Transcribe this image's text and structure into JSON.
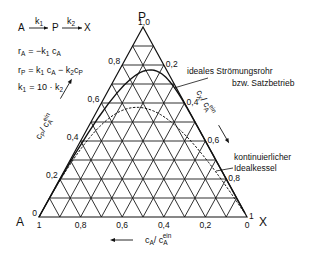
{
  "reaction": {
    "scheme": {
      "A": "A",
      "k1": "k",
      "k1_sub": "1",
      "P": "P",
      "k2": "k",
      "k2_sub": "2",
      "X": "X"
    },
    "rate_A": {
      "lhs": "r",
      "lhs_sub": "A",
      "rhs": "= −k",
      "rhs_sub1": "1",
      "c": " c",
      "c_sub": "A"
    },
    "rate_P": {
      "lhs": "r",
      "lhs_sub": "P",
      "rhs": "= k",
      "rhs_sub1": "1",
      "c1": " c",
      "c1_sub": "A",
      "minus": " − k",
      "k2_sub": "2",
      "c2": "c",
      "c2_sub": "P"
    },
    "ratio": {
      "lhs": "k",
      "lhs_sub": "1",
      "rhs": "= 10 · k",
      "rhs_sub": "2"
    }
  },
  "diagram": {
    "vertex_labels": {
      "A": "A",
      "P": "P",
      "X": "X"
    },
    "left_axis": {
      "name": "c_P / c_A^ein",
      "label_c": "c",
      "label_c_sub": "P",
      "label_slash": "/ c",
      "label_sub": "A",
      "label_sup": "ein",
      "ticks": [
        "0",
        "0,2",
        "0,4",
        "0,6",
        "0,8",
        "1,0"
      ]
    },
    "right_axis": {
      "name": "c_X / c_A^ein",
      "label_c": "c",
      "label_c_sub": "X",
      "label_slash": "/ c",
      "label_sub": "A",
      "label_sup": "ein",
      "ticks": [
        "0",
        "0,2",
        "0,4",
        "0,6",
        "0,8",
        "1"
      ]
    },
    "bottom_axis": {
      "name": "c_A / c_A^ein",
      "label_c": "c",
      "label_c_sub": "A",
      "label_slash": "/ c",
      "label_sub": "A",
      "label_sup": "ein",
      "ticks": [
        "1",
        "0,8",
        "0,6",
        "0,4",
        "0,2",
        "0"
      ]
    },
    "grid_divisions": 10,
    "annotations": {
      "pfr_line1": "ideales Strömungsrohr",
      "pfr_line2": "bzw. Satzbetrieb",
      "cstr_line1": "kontinuierlicher",
      "cstr_line2": "Idealkessel"
    },
    "model": {
      "k2_over_k1": 0.1,
      "curves": [
        {
          "name": "ideales Strömungsrohr bzw. Satzbetrieb",
          "style": "solid",
          "max_cP": 0.774
        },
        {
          "name": "kontinuierlicher Idealkessel",
          "style": "dashed",
          "max_cP": 0.577
        }
      ]
    }
  }
}
